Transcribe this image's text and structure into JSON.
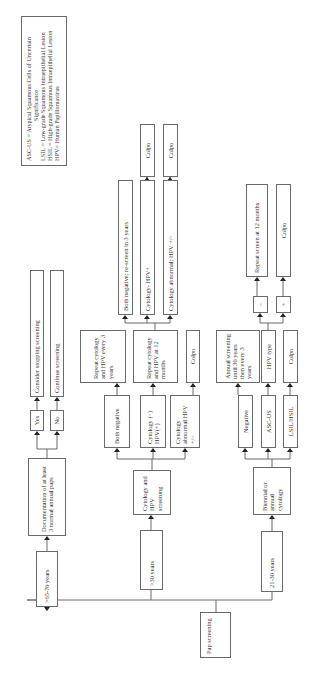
{
  "diagram": {
    "orientation": "rotated 90 degrees counter-clockwise",
    "root": "Pap screening",
    "branches": [
      {
        "age": ">65-70 years",
        "step": "Documentation of at least 3 normal annual paps",
        "outcomes": [
          {
            "label": "Yes",
            "next": "Consider stopping screening"
          },
          {
            "label": "No",
            "next": "Continue screening"
          }
        ]
      },
      {
        "age": ">30 years",
        "step": "Cytology and HPV screening",
        "outcomes": [
          {
            "label": "Both negative",
            "next": "Repeat cytology and HPV every 3 years"
          },
          {
            "label": "Cytology (−) HPV(+)",
            "next": "Repeat cytology and HPV at 12 months",
            "followups": [
              {
                "label": "Both negative; re-screen in 3 years"
              },
              {
                "label": "Cytology- HPV+",
                "next": "Colpo"
              },
              {
                "label": "Cytology abnormal; HPV +/−",
                "next": "Colpo"
              }
            ]
          },
          {
            "label": "Cytology abnormal HPV +/−",
            "next": "Colpo"
          }
        ]
      },
      {
        "age": "21-30 years",
        "step": "Biennial or annual cytology",
        "outcomes": [
          {
            "label": "Negative",
            "next": "Annual screening until 30 years then every 3 years"
          },
          {
            "label": "ASC-US",
            "next": "HPV type",
            "followups": [
              {
                "label": "−",
                "next": "Repeat screen at 12 months"
              },
              {
                "label": "+",
                "next": "Colpo"
              }
            ]
          },
          {
            "label": "LSIL/HSIL",
            "next": "Colpo"
          }
        ]
      }
    ]
  },
  "boxes": {
    "pap": "Pap screening",
    "age65": ">65-70 years",
    "doc3": "Documentation of at least 3 normal annual paps",
    "yes": "Yes",
    "no": "No",
    "stop": "Consider stopping screening",
    "continue": "Continue screening",
    "age30": ">30 years",
    "cythpv": "Cytology and HPV screening",
    "bothneg": "Both negative",
    "cytneg_hpvpos": "Cytology (−) HPV(+)",
    "cytabn": "Cytology abnormal HPV +/−",
    "repeat3": "Repeat cytology and HPV every 3 years",
    "repeat12": "Repeat cytology and HPV at 12 months",
    "colpo_a": "Colpo",
    "rescreen": "Both negative; re-screen in 3 years",
    "cyt_hpvpos": "Cytology- HPV+",
    "cytabn2": "Cytology abnormal; HPV +/−",
    "colpo_b": "Colpo",
    "colpo_c": "Colpo",
    "age21": "21-30 years",
    "biennial": "Biennial or annual cytology",
    "negative": "Negative",
    "ascus": "ASC-US",
    "lsil": "LSIL/HSIL",
    "annual": "Annual screening until 30 years then every 3 years",
    "hpvtype": "HPV type",
    "colpo_d": "Colpo",
    "minus": "−",
    "plus": "+",
    "repeat_screen12": "Repeat screen at 12 months",
    "colpo_e": "Colpo"
  },
  "legend": {
    "lines": [
      "ASC-US = Atypical Squamous Cells of Uncertain",
      "Significance",
      "LSIL = Low-grade Squamous Intraepithelial Lesion",
      "HSIL = High-grade Squamous Intraepithelial Lesion",
      "HPV= Human Papillomavirus"
    ]
  }
}
